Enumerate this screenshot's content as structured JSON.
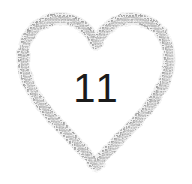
{
  "canvas": {
    "width": 192,
    "height": 184,
    "background_color": "#ffffff"
  },
  "badge": {
    "shape_name": "heart-outline",
    "style": "hand-drawn sketchy halftone brush stroke",
    "stroke_color_dark": "#9a9a9a",
    "stroke_color_mid": "#b5b5b5",
    "stroke_color_light": "#d4d4d4",
    "fill_color": "#ffffff",
    "stroke_width": 9
  },
  "number": {
    "value": "11",
    "color": "#1b1b1b",
    "font_size_px": 40
  }
}
